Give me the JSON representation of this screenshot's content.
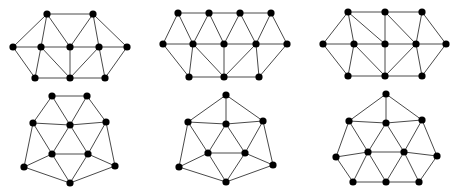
{
  "figure": {
    "edge_color": "#4a4a4a",
    "node_color": "#000000",
    "node_radius": 3.6
  },
  "graphs": [
    {
      "id": "graph-1",
      "nodes": [
        [
          47,
          14
        ],
        [
          93,
          14
        ],
        [
          13,
          47
        ],
        [
          41,
          47
        ],
        [
          70,
          47
        ],
        [
          99,
          47
        ],
        [
          127,
          47
        ],
        [
          35,
          78
        ],
        [
          70,
          78
        ],
        [
          105,
          78
        ]
      ],
      "edges": [
        [
          0,
          1
        ],
        [
          0,
          2
        ],
        [
          0,
          3
        ],
        [
          0,
          4
        ],
        [
          1,
          4
        ],
        [
          1,
          5
        ],
        [
          1,
          6
        ],
        [
          2,
          3
        ],
        [
          3,
          4
        ],
        [
          4,
          5
        ],
        [
          5,
          6
        ],
        [
          2,
          7
        ],
        [
          3,
          7
        ],
        [
          3,
          8
        ],
        [
          4,
          8
        ],
        [
          5,
          8
        ],
        [
          5,
          9
        ],
        [
          6,
          9
        ],
        [
          7,
          8
        ],
        [
          8,
          9
        ]
      ]
    },
    {
      "id": "graph-2",
      "nodes": [
        [
          178,
          13
        ],
        [
          209,
          13
        ],
        [
          240,
          13
        ],
        [
          271,
          13
        ],
        [
          163,
          44
        ],
        [
          193,
          44
        ],
        [
          224,
          44
        ],
        [
          256,
          44
        ],
        [
          287,
          44
        ],
        [
          189,
          77
        ],
        [
          224,
          77
        ],
        [
          259,
          77
        ]
      ],
      "edges": [
        [
          0,
          1
        ],
        [
          1,
          2
        ],
        [
          2,
          3
        ],
        [
          0,
          4
        ],
        [
          0,
          5
        ],
        [
          1,
          5
        ],
        [
          1,
          6
        ],
        [
          2,
          6
        ],
        [
          2,
          7
        ],
        [
          3,
          7
        ],
        [
          3,
          8
        ],
        [
          4,
          5
        ],
        [
          5,
          6
        ],
        [
          6,
          7
        ],
        [
          7,
          8
        ],
        [
          4,
          9
        ],
        [
          5,
          9
        ],
        [
          5,
          10
        ],
        [
          6,
          10
        ],
        [
          7,
          10
        ],
        [
          7,
          11
        ],
        [
          8,
          11
        ],
        [
          9,
          10
        ],
        [
          10,
          11
        ]
      ]
    },
    {
      "id": "graph-3",
      "nodes": [
        [
          348,
          12
        ],
        [
          385,
          12
        ],
        [
          422,
          12
        ],
        [
          323,
          44
        ],
        [
          354,
          44
        ],
        [
          385,
          44
        ],
        [
          416,
          44
        ],
        [
          446,
          44
        ],
        [
          348,
          76
        ],
        [
          385,
          76
        ],
        [
          422,
          76
        ]
      ],
      "edges": [
        [
          0,
          1
        ],
        [
          1,
          2
        ],
        [
          0,
          3
        ],
        [
          0,
          4
        ],
        [
          0,
          5
        ],
        [
          1,
          5
        ],
        [
          1,
          6
        ],
        [
          2,
          6
        ],
        [
          2,
          7
        ],
        [
          3,
          4
        ],
        [
          4,
          5
        ],
        [
          5,
          6
        ],
        [
          6,
          7
        ],
        [
          3,
          8
        ],
        [
          4,
          8
        ],
        [
          4,
          9
        ],
        [
          5,
          9
        ],
        [
          6,
          9
        ],
        [
          6,
          10
        ],
        [
          7,
          10
        ],
        [
          8,
          9
        ],
        [
          9,
          10
        ]
      ]
    },
    {
      "id": "graph-4",
      "nodes": [
        [
          52,
          96
        ],
        [
          87,
          96
        ],
        [
          33,
          123
        ],
        [
          70,
          125
        ],
        [
          106,
          122
        ],
        [
          52,
          154
        ],
        [
          88,
          154
        ],
        [
          24,
          167
        ],
        [
          115,
          166
        ],
        [
          70,
          183
        ]
      ],
      "edges": [
        [
          0,
          1
        ],
        [
          0,
          2
        ],
        [
          0,
          3
        ],
        [
          1,
          3
        ],
        [
          1,
          4
        ],
        [
          2,
          3
        ],
        [
          3,
          4
        ],
        [
          2,
          5
        ],
        [
          3,
          5
        ],
        [
          3,
          6
        ],
        [
          4,
          6
        ],
        [
          5,
          6
        ],
        [
          2,
          7
        ],
        [
          4,
          8
        ],
        [
          7,
          5
        ],
        [
          6,
          8
        ],
        [
          7,
          9
        ],
        [
          5,
          9
        ],
        [
          6,
          9
        ],
        [
          8,
          9
        ]
      ]
    },
    {
      "id": "graph-5",
      "nodes": [
        [
          226,
          95
        ],
        [
          188,
          122
        ],
        [
          226,
          124
        ],
        [
          263,
          121
        ],
        [
          208,
          153
        ],
        [
          245,
          153
        ],
        [
          179,
          167
        ],
        [
          273,
          165
        ],
        [
          226,
          182
        ]
      ],
      "edges": [
        [
          0,
          1
        ],
        [
          0,
          2
        ],
        [
          0,
          3
        ],
        [
          1,
          2
        ],
        [
          2,
          3
        ],
        [
          1,
          4
        ],
        [
          2,
          4
        ],
        [
          2,
          5
        ],
        [
          3,
          5
        ],
        [
          4,
          5
        ],
        [
          1,
          6
        ],
        [
          3,
          7
        ],
        [
          6,
          4
        ],
        [
          5,
          7
        ],
        [
          6,
          8
        ],
        [
          4,
          8
        ],
        [
          5,
          8
        ],
        [
          7,
          8
        ]
      ]
    },
    {
      "id": "graph-6",
      "nodes": [
        [
          386,
          94
        ],
        [
          349,
          121
        ],
        [
          386,
          123
        ],
        [
          422,
          120
        ],
        [
          336,
          157
        ],
        [
          368,
          152
        ],
        [
          404,
          152
        ],
        [
          437,
          156
        ],
        [
          353,
          182
        ],
        [
          386,
          182
        ],
        [
          419,
          182
        ]
      ],
      "edges": [
        [
          0,
          1
        ],
        [
          0,
          2
        ],
        [
          0,
          3
        ],
        [
          1,
          2
        ],
        [
          2,
          3
        ],
        [
          1,
          5
        ],
        [
          2,
          5
        ],
        [
          2,
          6
        ],
        [
          3,
          6
        ],
        [
          1,
          4
        ],
        [
          3,
          7
        ],
        [
          4,
          5
        ],
        [
          5,
          6
        ],
        [
          6,
          7
        ],
        [
          4,
          8
        ],
        [
          5,
          8
        ],
        [
          5,
          9
        ],
        [
          6,
          9
        ],
        [
          6,
          10
        ],
        [
          7,
          10
        ],
        [
          8,
          9
        ],
        [
          9,
          10
        ]
      ]
    }
  ]
}
